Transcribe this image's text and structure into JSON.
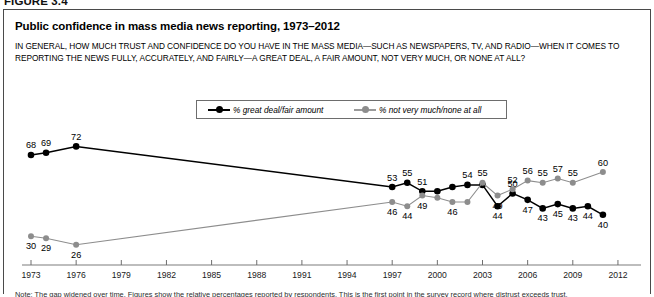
{
  "figure": {
    "number": "FIGURE 3.4",
    "title": "Public confidence in mass media news reporting, 1973–2012",
    "question": "IN GENERAL, HOW MUCH TRUST AND CONFIDENCE DO YOU HAVE IN THE MASS MEDIA—SUCH AS NEWSPAPERS, TV, AND RADIO—WHEN IT COMES TO REPORTING THE NEWS FULLY, ACCURATELY, AND FAIRLY—A GREAT DEAL, A FAIR AMOUNT, NOT VERY MUCH, OR NONE AT ALL?",
    "note": "Note: The gap widened over time. Figures show the relative percentages reported by respondents. This is the first point in the survey record where distrust exceeds trust."
  },
  "legend": {
    "items": [
      {
        "label": "% great deal/fair amount",
        "color": "#000000",
        "marker": "dark"
      },
      {
        "label": "% not very much/none at all",
        "color": "#8d8d8d",
        "marker": "light"
      }
    ]
  },
  "chart_data": {
    "type": "line",
    "title": "Public confidence in mass media news reporting, 1973–2012",
    "xlabel": "",
    "ylabel": "",
    "xlim": [
      1973,
      2012
    ],
    "ylim": [
      20,
      75
    ],
    "grid": false,
    "legend_position": "top-center",
    "tick_labels": [
      "1973",
      "1976",
      "1979",
      "1982",
      "1985",
      "1988",
      "1991",
      "1994",
      "1997",
      "2000",
      "2003",
      "2006",
      "2009",
      "2012"
    ],
    "series": [
      {
        "name": "% great deal/fair amount",
        "color": "#000000",
        "points": [
          {
            "x": 1973,
            "y": 68,
            "label": "68",
            "label_pos": "above"
          },
          {
            "x": 1974,
            "y": 69,
            "label": "69",
            "label_pos": "above"
          },
          {
            "x": 1976,
            "y": 72,
            "label": "72",
            "label_pos": "above"
          },
          {
            "x": 1997,
            "y": 53,
            "label": "53",
            "label_pos": "above"
          },
          {
            "x": 1998,
            "y": 55,
            "label": "55",
            "label_pos": "above"
          },
          {
            "x": 1999,
            "y": 51,
            "label": "51",
            "label_pos": "above"
          },
          {
            "x": 2000,
            "y": 51,
            "label": "",
            "label_pos": "above"
          },
          {
            "x": 2001,
            "y": 53,
            "label": "",
            "label_pos": "above"
          },
          {
            "x": 2002,
            "y": 54,
            "label": "54",
            "label_pos": "above"
          },
          {
            "x": 2003,
            "y": 54,
            "label": "",
            "label_pos": "above"
          },
          {
            "x": 2004,
            "y": 44,
            "label": "44",
            "label_pos": "below"
          },
          {
            "x": 2005,
            "y": 50,
            "label": "50",
            "label_pos": "above"
          },
          {
            "x": 2006,
            "y": 47,
            "label": "47",
            "label_pos": "below"
          },
          {
            "x": 2007,
            "y": 43,
            "label": "43",
            "label_pos": "below"
          },
          {
            "x": 2008,
            "y": 45,
            "label": "45",
            "label_pos": "below"
          },
          {
            "x": 2009,
            "y": 43,
            "label": "43",
            "label_pos": "below"
          },
          {
            "x": 2010,
            "y": 44,
            "label": "44",
            "label_pos": "below"
          },
          {
            "x": 2011,
            "y": 40,
            "label": "40",
            "label_pos": "below"
          }
        ]
      },
      {
        "name": "% not very much/none at all",
        "color": "#8d8d8d",
        "points": [
          {
            "x": 1973,
            "y": 30,
            "label": "30",
            "label_pos": "below"
          },
          {
            "x": 1974,
            "y": 29,
            "label": "29",
            "label_pos": "below"
          },
          {
            "x": 1976,
            "y": 26,
            "label": "26",
            "label_pos": "below"
          },
          {
            "x": 1997,
            "y": 46,
            "label": "46",
            "label_pos": "below"
          },
          {
            "x": 1998,
            "y": 44,
            "label": "44",
            "label_pos": "below"
          },
          {
            "x": 1999,
            "y": 49,
            "label": "49",
            "label_pos": "below"
          },
          {
            "x": 2000,
            "y": 48,
            "label": "",
            "label_pos": "below"
          },
          {
            "x": 2001,
            "y": 46,
            "label": "46",
            "label_pos": "below"
          },
          {
            "x": 2002,
            "y": 46,
            "label": "",
            "label_pos": "below"
          },
          {
            "x": 2003,
            "y": 55,
            "label": "55",
            "label_pos": "above"
          },
          {
            "x": 2004,
            "y": 49,
            "label": "49",
            "label_pos": "below"
          },
          {
            "x": 2005,
            "y": 52,
            "label": "52",
            "label_pos": "above"
          },
          {
            "x": 2006,
            "y": 56,
            "label": "56",
            "label_pos": "above"
          },
          {
            "x": 2007,
            "y": 55,
            "label": "55",
            "label_pos": "above"
          },
          {
            "x": 2008,
            "y": 57,
            "label": "57",
            "label_pos": "above"
          },
          {
            "x": 2009,
            "y": 55,
            "label": "55",
            "label_pos": "above"
          },
          {
            "x": 2011,
            "y": 60,
            "label": "60",
            "label_pos": "above"
          }
        ]
      }
    ]
  }
}
